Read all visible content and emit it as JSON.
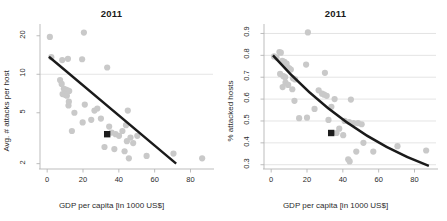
{
  "figure": {
    "width": 447,
    "height": 221,
    "background": "#ffffff",
    "panels": [
      "left",
      "right"
    ]
  },
  "colors": {
    "point": "#c9c9c9",
    "highlight": "#1c1c1c",
    "trend": "#1a1a1a",
    "grid": "#d9d9d9",
    "axis": "#b5b5b5",
    "text": "#2b2b2b"
  },
  "chart_data": [
    {
      "id": "left",
      "type": "scatter",
      "title": "2011",
      "xlabel": "GDP per capita [in 1000 US$]",
      "ylabel": "Avg. # attacks per host",
      "xlim": [
        -4,
        92
      ],
      "ylim": [
        1.85,
        23
      ],
      "yscale": "log",
      "xticks": [
        0,
        20,
        40,
        60,
        80
      ],
      "yticks": [
        2,
        5,
        10,
        20
      ],
      "ytick_labels": [
        "2",
        "5",
        "10",
        "20"
      ],
      "xtick_labels": [
        "0",
        "20",
        "40",
        "60",
        "80"
      ],
      "grid": "horizontal-at-10",
      "legend": "none",
      "points": [
        [
          1.5,
          19.6
        ],
        [
          20.5,
          21.2
        ],
        [
          2.3,
          13.6
        ],
        [
          8.4,
          12.9
        ],
        [
          11.6,
          13.2
        ],
        [
          19.5,
          13.1
        ],
        [
          33.5,
          11.3
        ],
        [
          7.2,
          9.0
        ],
        [
          8.1,
          8.4
        ],
        [
          9.3,
          7.7
        ],
        [
          10.4,
          7.6
        ],
        [
          11.4,
          7.5
        ],
        [
          12.3,
          7.4
        ],
        [
          8.6,
          7.0
        ],
        [
          10.2,
          6.9
        ],
        [
          11.0,
          6.8
        ],
        [
          11.9,
          5.7
        ],
        [
          21.0,
          5.8
        ],
        [
          26.4,
          5.2
        ],
        [
          28.0,
          5.4
        ],
        [
          15.2,
          5.0
        ],
        [
          45.0,
          5.2
        ],
        [
          12.1,
          6.1
        ],
        [
          19.8,
          4.2
        ],
        [
          24.6,
          4.4
        ],
        [
          30.0,
          4.5
        ],
        [
          13.8,
          3.6
        ],
        [
          34.6,
          3.9
        ],
        [
          36.0,
          3.5
        ],
        [
          38.2,
          3.4
        ],
        [
          40.1,
          3.3
        ],
        [
          42.0,
          3.6
        ],
        [
          44.5,
          3.0
        ],
        [
          44.0,
          4.0
        ],
        [
          46.5,
          3.2
        ],
        [
          50.3,
          3.3
        ],
        [
          37.5,
          2.6
        ],
        [
          43.2,
          2.5
        ],
        [
          45.6,
          2.2
        ],
        [
          55.5,
          2.3
        ],
        [
          70.5,
          2.4
        ],
        [
          86.5,
          2.2
        ],
        [
          32.0,
          2.7
        ],
        [
          48.0,
          2.9
        ]
      ],
      "highlight_point": [
        33.5,
        3.4
      ],
      "trend": {
        "type": "line",
        "from": [
          1.0,
          13.7
        ],
        "to": [
          72.0,
          2.0
        ]
      }
    },
    {
      "id": "right",
      "type": "scatter",
      "title": "2011",
      "xlabel": "GDP per capita [in 1000 US$]",
      "ylabel": "% attacked hosts",
      "xlim": [
        -4,
        92
      ],
      "ylim": [
        0.285,
        0.925
      ],
      "yscale": "linear",
      "xticks": [
        0,
        20,
        40,
        60,
        80
      ],
      "yticks": [
        0.3,
        0.4,
        0.5,
        0.6,
        0.7,
        0.8,
        0.9
      ],
      "ytick_labels": [
        "0.3",
        "0.4",
        "0.5",
        "0.6",
        "0.7",
        "0.8",
        "0.9"
      ],
      "xtick_labels": [
        "0",
        "20",
        "40",
        "60",
        "80"
      ],
      "grid": "horizontal",
      "legend": "none",
      "points": [
        [
          20.5,
          0.905
        ],
        [
          1.6,
          0.795
        ],
        [
          4.6,
          0.815
        ],
        [
          5.4,
          0.812
        ],
        [
          3.0,
          0.79
        ],
        [
          6.2,
          0.775
        ],
        [
          7.4,
          0.77
        ],
        [
          8.6,
          0.762
        ],
        [
          19.5,
          0.758
        ],
        [
          9.2,
          0.745
        ],
        [
          10.1,
          0.74
        ],
        [
          11.0,
          0.735
        ],
        [
          5.0,
          0.715
        ],
        [
          6.8,
          0.705
        ],
        [
          7.8,
          0.7
        ],
        [
          12.2,
          0.695
        ],
        [
          13.4,
          0.69
        ],
        [
          30.0,
          0.72
        ],
        [
          8.0,
          0.675
        ],
        [
          9.5,
          0.665
        ],
        [
          6.4,
          0.655
        ],
        [
          11.8,
          0.645
        ],
        [
          26.5,
          0.64
        ],
        [
          28.4,
          0.625
        ],
        [
          29.6,
          0.62
        ],
        [
          31.0,
          0.615
        ],
        [
          13.0,
          0.592
        ],
        [
          35.4,
          0.6
        ],
        [
          44.5,
          0.598
        ],
        [
          24.2,
          0.555
        ],
        [
          33.6,
          0.565
        ],
        [
          15.6,
          0.513
        ],
        [
          20.0,
          0.515
        ],
        [
          32.0,
          0.505
        ],
        [
          41.0,
          0.5
        ],
        [
          43.5,
          0.495
        ],
        [
          46.0,
          0.49
        ],
        [
          48.5,
          0.49
        ],
        [
          50.5,
          0.485
        ],
        [
          38.0,
          0.465
        ],
        [
          36.5,
          0.445
        ],
        [
          40.2,
          0.435
        ],
        [
          51.5,
          0.4
        ],
        [
          43.0,
          0.325
        ],
        [
          43.8,
          0.315
        ],
        [
          47.5,
          0.36
        ],
        [
          57.0,
          0.36
        ],
        [
          70.5,
          0.385
        ],
        [
          86.5,
          0.365
        ]
      ],
      "highlight_point": [
        33.5,
        0.445
      ],
      "trend": {
        "type": "curve",
        "from": [
          1.0,
          0.8
        ],
        "to": [
          88.0,
          0.295
        ],
        "control": [
          40.0,
          0.44
        ]
      }
    }
  ]
}
